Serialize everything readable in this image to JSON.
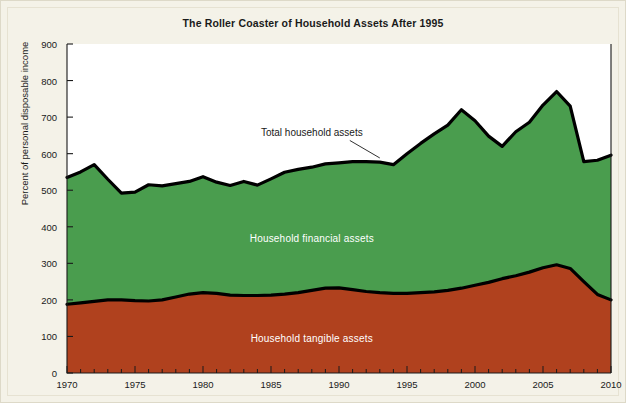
{
  "chart_data": {
    "type": "area",
    "title": "The Roller Coaster of Household Assets After 1995",
    "xlabel": "",
    "ylabel": "Percent of personal disposable income",
    "xlim": [
      1970,
      2010
    ],
    "ylim": [
      0,
      900
    ],
    "grid": false,
    "stacked": true,
    "legend_position": "inline-labels",
    "x": [
      1970,
      1971,
      1972,
      1973,
      1974,
      1975,
      1976,
      1977,
      1978,
      1979,
      1980,
      1981,
      1982,
      1983,
      1984,
      1985,
      1986,
      1987,
      1988,
      1989,
      1990,
      1991,
      1992,
      1993,
      1994,
      1995,
      1996,
      1997,
      1998,
      1999,
      2000,
      2001,
      2002,
      2003,
      2004,
      2005,
      2006,
      2007,
      2008,
      2009,
      2010
    ],
    "xticks": [
      1970,
      1975,
      1980,
      1985,
      1990,
      1995,
      2000,
      2005,
      2010
    ],
    "xtick_labels": [
      "1970",
      "1975",
      "1980",
      "1985",
      "1990",
      "1995",
      "2000",
      "2005",
      "2010"
    ],
    "yticks": [
      0,
      100,
      200,
      300,
      400,
      500,
      600,
      700,
      800,
      900
    ],
    "ytick_labels": [
      "0",
      "100",
      "200",
      "300",
      "400",
      "500",
      "600",
      "700",
      "800",
      "900"
    ],
    "series": [
      {
        "name": "Household tangible assets",
        "color": "#b0411e",
        "label_x": 1988,
        "label_y": 95,
        "values": [
          188,
          192,
          196,
          200,
          200,
          198,
          197,
          200,
          208,
          216,
          220,
          218,
          213,
          212,
          212,
          213,
          216,
          220,
          226,
          232,
          233,
          228,
          223,
          220,
          218,
          218,
          220,
          222,
          226,
          232,
          240,
          248,
          258,
          266,
          276,
          288,
          296,
          286,
          250,
          215,
          200
        ]
      },
      {
        "name": "Household financial assets",
        "color": "#4a9d4e",
        "label_x": 1988,
        "label_y": 370,
        "values": [
          347,
          358,
          374,
          330,
          292,
          297,
          318,
          312,
          310,
          308,
          317,
          304,
          300,
          312,
          302,
          318,
          333,
          337,
          337,
          340,
          342,
          350,
          355,
          357,
          352,
          382,
          408,
          432,
          452,
          488,
          450,
          400,
          362,
          394,
          410,
          445,
          474,
          444,
          328,
          367,
          396
        ]
      }
    ],
    "total_series": {
      "name": "Total household assets",
      "values": [
        535,
        550,
        570,
        530,
        492,
        495,
        515,
        512,
        518,
        524,
        537,
        522,
        513,
        524,
        514,
        531,
        549,
        557,
        563,
        572,
        575,
        578,
        578,
        577,
        570,
        600,
        628,
        654,
        678,
        720,
        690,
        648,
        620,
        660,
        686,
        733,
        770,
        730,
        578,
        582,
        596
      ],
      "annotation": "Total household assets",
      "annotation_x": 1988,
      "annotation_y": 658,
      "leader_to_x": 1993,
      "leader_to_y": 580
    }
  }
}
